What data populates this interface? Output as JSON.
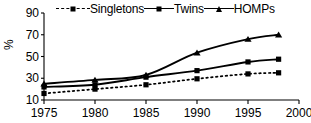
{
  "chart_data": {
    "type": "line",
    "title": "",
    "xlabel": "",
    "ylabel": "%",
    "xlim": [
      1975,
      2000
    ],
    "ylim": [
      10,
      90
    ],
    "grid": false,
    "legend_position": "top",
    "xticks": [
      "1975",
      "1980",
      "1985",
      "1990",
      "1995",
      "2000"
    ],
    "xtick_values": [
      1975,
      1980,
      1985,
      1990,
      1995,
      2000
    ],
    "yticks": [
      "10",
      "30",
      "50",
      "70",
      "90"
    ],
    "ytick_values": [
      10,
      30,
      50,
      70,
      90
    ],
    "x": [
      1975,
      1980,
      1985,
      1990,
      1995,
      1998
    ],
    "series": [
      {
        "name": "Singletons",
        "values": [
          16,
          20,
          24,
          29.5,
          34,
          35
        ],
        "style": "dashed",
        "marker": "square",
        "color": "#000000"
      },
      {
        "name": "Twins",
        "values": [
          22,
          24,
          31,
          37,
          45,
          47.5
        ],
        "style": "solid",
        "marker": "square",
        "color": "#000000"
      },
      {
        "name": "HOMPs",
        "values": [
          25,
          28.5,
          33,
          53.5,
          66,
          70
        ],
        "style": "solid",
        "marker": "triangle",
        "color": "#000000"
      }
    ]
  },
  "legend": {
    "items": [
      {
        "label": "Singletons"
      },
      {
        "label": "Twins"
      },
      {
        "label": "HOMPs"
      }
    ]
  },
  "axis": {
    "y_axis_title": "%"
  }
}
